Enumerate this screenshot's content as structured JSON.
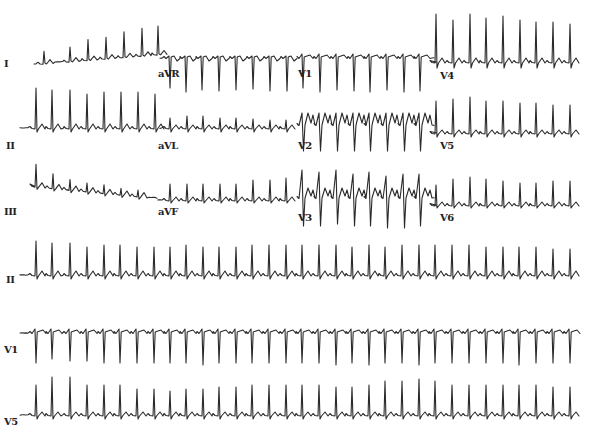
{
  "figure": {
    "type": "12-lead ECG tracing",
    "background": "#ffffff",
    "trace_color": "#2a2a2a"
  },
  "rows": [
    {
      "row": 1,
      "leads": [
        {
          "label": "I",
          "x0": 34,
          "x1": 158,
          "baseline": 58,
          "label_x": 4,
          "label_y": 68,
          "beats": [
            44,
            70,
            88,
            106,
            124,
            142,
            158
          ],
          "r": [
            12,
            14,
            20,
            21,
            25,
            27,
            28
          ],
          "s": [
            0,
            0,
            0,
            0,
            0,
            0,
            0
          ],
          "t": 3,
          "morph": "upright",
          "drift": [
            6,
            -4
          ]
        },
        {
          "label": "aVR",
          "x0": 160,
          "x1": 296,
          "baseline": 58,
          "label_x": 158,
          "label_y": 78,
          "beats": [
            170,
            186,
            202,
            219,
            236,
            253,
            270,
            287
          ],
          "r": [
            2,
            2,
            2,
            2,
            2,
            2,
            2,
            2
          ],
          "s": [
            30,
            34,
            32,
            33,
            32,
            31,
            33,
            33
          ],
          "t": -3,
          "morph": "inverted",
          "drift": [
            0,
            0
          ]
        },
        {
          "label": "V1",
          "x0": 298,
          "x1": 434,
          "baseline": 58,
          "label_x": 298,
          "label_y": 78,
          "beats": [
            303,
            320,
            337,
            354,
            370,
            387,
            404,
            420
          ],
          "r": [
            4,
            4,
            4,
            4,
            4,
            4,
            4,
            4
          ],
          "s": [
            30,
            34,
            32,
            33,
            34,
            32,
            34,
            33
          ],
          "t": 3,
          "morph": "inverted",
          "drift": [
            0,
            0
          ]
        },
        {
          "label": "V4",
          "x0": 436,
          "x1": 572,
          "baseline": 62,
          "label_x": 440,
          "label_y": 80,
          "beats": [
            436,
            453,
            470,
            486,
            503,
            520,
            536,
            553,
            570
          ],
          "r": [
            48,
            42,
            48,
            44,
            46,
            42,
            40,
            40,
            38
          ],
          "s": [
            6,
            6,
            6,
            6,
            6,
            6,
            6,
            6,
            6
          ],
          "t": 4,
          "morph": "upright",
          "drift": [
            0,
            0
          ]
        }
      ]
    },
    {
      "row": 2,
      "leads": [
        {
          "label": "II",
          "x0": 20,
          "x1": 158,
          "baseline": 128,
          "label_x": 6,
          "label_y": 150,
          "beats": [
            36,
            52,
            70,
            87,
            104,
            121,
            138,
            155
          ],
          "r": [
            40,
            38,
            38,
            34,
            36,
            36,
            36,
            34
          ],
          "s": [
            4,
            4,
            4,
            4,
            4,
            4,
            4,
            4
          ],
          "t": 4,
          "morph": "upright",
          "drift": [
            0,
            0
          ]
        },
        {
          "label": "aVL",
          "x0": 160,
          "x1": 296,
          "baseline": 128,
          "label_x": 158,
          "label_y": 150,
          "beats": [
            170,
            187,
            203,
            220,
            236,
            253,
            270,
            286
          ],
          "r": [
            10,
            12,
            12,
            10,
            10,
            9,
            8,
            8
          ],
          "s": [
            4,
            4,
            4,
            4,
            4,
            4,
            4,
            4
          ],
          "t": 3,
          "morph": "upright",
          "drift": [
            0,
            0
          ]
        },
        {
          "label": "V2",
          "x0": 298,
          "x1": 434,
          "baseline": 125,
          "label_x": 298,
          "label_y": 150,
          "beats": [
            303,
            320,
            337,
            354,
            370,
            387,
            404,
            420
          ],
          "r": [
            12,
            12,
            12,
            12,
            12,
            12,
            12,
            12
          ],
          "s": [
            26,
            26,
            26,
            26,
            26,
            26,
            26,
            26
          ],
          "t": 12,
          "morph": "biphasic",
          "drift": [
            0,
            0
          ]
        },
        {
          "label": "V5",
          "x0": 436,
          "x1": 572,
          "baseline": 133,
          "label_x": 440,
          "label_y": 150,
          "beats": [
            436,
            453,
            470,
            486,
            503,
            520,
            536,
            553,
            570
          ],
          "r": [
            32,
            34,
            36,
            32,
            32,
            30,
            30,
            28,
            28
          ],
          "s": [
            4,
            4,
            4,
            4,
            4,
            4,
            4,
            4,
            4
          ],
          "t": 3,
          "morph": "upright",
          "drift": [
            0,
            0
          ]
        }
      ]
    },
    {
      "row": 3,
      "leads": [
        {
          "label": "III",
          "x0": 34,
          "x1": 158,
          "baseline": 190,
          "label_x": 4,
          "label_y": 216,
          "beats": [
            36,
            53,
            70,
            87,
            104,
            121,
            138
          ],
          "r": [
            22,
            14,
            10,
            8,
            8,
            6,
            6
          ],
          "s": [
            3,
            3,
            3,
            3,
            3,
            3,
            3
          ],
          "t": 4,
          "morph": "upright",
          "drift": [
            -4,
            8
          ]
        },
        {
          "label": "aVF",
          "x0": 158,
          "x1": 296,
          "baseline": 200,
          "label_x": 158,
          "label_y": 216,
          "beats": [
            170,
            187,
            203,
            220,
            236,
            253,
            270,
            286
          ],
          "r": [
            16,
            16,
            16,
            16,
            16,
            20,
            20,
            22
          ],
          "s": [
            3,
            3,
            3,
            3,
            3,
            3,
            3,
            3
          ],
          "t": 3,
          "morph": "upright",
          "drift": [
            0,
            0
          ]
        },
        {
          "label": "V3",
          "x0": 298,
          "x1": 434,
          "baseline": 198,
          "label_x": 298,
          "label_y": 222,
          "beats": [
            303,
            320,
            337,
            354,
            370,
            387,
            404,
            420
          ],
          "r": [
            28,
            26,
            28,
            24,
            26,
            22,
            24,
            24
          ],
          "s": [
            28,
            28,
            26,
            28,
            28,
            30,
            30,
            28
          ],
          "t": 10,
          "morph": "biphasic",
          "drift": [
            0,
            0
          ]
        },
        {
          "label": "V6",
          "x0": 436,
          "x1": 572,
          "baseline": 205,
          "label_x": 440,
          "label_y": 222,
          "beats": [
            436,
            453,
            470,
            486,
            503,
            520,
            536,
            553,
            570
          ],
          "r": [
            20,
            26,
            28,
            26,
            24,
            22,
            22,
            24,
            24
          ],
          "s": [
            3,
            3,
            3,
            3,
            3,
            3,
            3,
            3,
            3
          ],
          "t": 3,
          "morph": "upright",
          "drift": [
            0,
            0
          ]
        }
      ]
    },
    {
      "row": 4,
      "leads": [
        {
          "label": "II",
          "x0": 20,
          "x1": 572,
          "baseline": 275,
          "label_x": 6,
          "label_y": 284,
          "beats": [
            36,
            52,
            70,
            87,
            104,
            120,
            137,
            154,
            170,
            186,
            203,
            219,
            236,
            252,
            269,
            286,
            302,
            319,
            336,
            352,
            369,
            385,
            402,
            419,
            435,
            452,
            469,
            486,
            503,
            519,
            536,
            553,
            570
          ],
          "r": [
            34,
            32,
            32,
            28,
            30,
            30,
            28,
            28,
            28,
            30,
            28,
            28,
            28,
            30,
            30,
            30,
            30,
            30,
            30,
            28,
            30,
            28,
            30,
            30,
            30,
            30,
            30,
            28,
            28,
            28,
            28,
            26,
            26
          ],
          "s": [
            4
          ],
          "t": 4,
          "morph": "upright",
          "drift": [
            0,
            0
          ]
        }
      ]
    },
    {
      "row": 5,
      "leads": [
        {
          "label": "V1",
          "x0": 20,
          "x1": 572,
          "baseline": 333,
          "label_x": 4,
          "label_y": 354,
          "beats": [
            36,
            52,
            70,
            87,
            104,
            120,
            137,
            154,
            170,
            186,
            203,
            219,
            236,
            252,
            269,
            286,
            302,
            319,
            336,
            352,
            369,
            385,
            402,
            419,
            435,
            452,
            469,
            486,
            503,
            519,
            536,
            553,
            570
          ],
          "r": [
            4
          ],
          "s": [
            30,
            26,
            28,
            28,
            30,
            30,
            30,
            30,
            30,
            30,
            32,
            30,
            30,
            30,
            30,
            30,
            30,
            30,
            32,
            30,
            32,
            30,
            30,
            32,
            30,
            30,
            30,
            30,
            30,
            32,
            30,
            30,
            30
          ],
          "t": 3,
          "morph": "inverted",
          "drift": [
            0,
            0
          ]
        }
      ]
    },
    {
      "row": 6,
      "leads": [
        {
          "label": "V5",
          "x0": 20,
          "x1": 572,
          "baseline": 415,
          "label_x": 4,
          "label_y": 426,
          "beats": [
            36,
            52,
            70,
            87,
            104,
            120,
            137,
            154,
            170,
            186,
            203,
            219,
            236,
            252,
            269,
            286,
            302,
            319,
            336,
            352,
            369,
            385,
            402,
            419,
            435,
            452,
            469,
            486,
            503,
            519,
            536,
            553,
            570
          ],
          "r": [
            30,
            38,
            38,
            30,
            30,
            30,
            26,
            26,
            24,
            26,
            26,
            28,
            28,
            30,
            30,
            30,
            30,
            30,
            28,
            28,
            30,
            34,
            34,
            36,
            34,
            30,
            30,
            30,
            30,
            30,
            30,
            28,
            28
          ],
          "s": [
            4
          ],
          "t": 3,
          "morph": "upright",
          "drift": [
            0,
            0
          ]
        }
      ]
    }
  ],
  "labels": [
    "I",
    "aVR",
    "V1",
    "V4",
    "II",
    "aVL",
    "V2",
    "V5",
    "III",
    "aVF",
    "V3",
    "V6",
    "II",
    "V1",
    "V5"
  ],
  "rhythm_strips": [
    "II",
    "V1",
    "V5"
  ],
  "observations": {
    "rhythm": "regular narrow-complex tachycardia",
    "approx_rr_px": 16.8
  }
}
